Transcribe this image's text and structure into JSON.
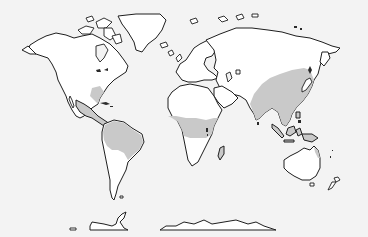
{
  "map": {
    "type": "world-outline-map",
    "projection": "approx. Mercator-like",
    "colors": {
      "background": "#f3f3f3",
      "land": "#ffffff",
      "highlighted_region": "#c9c9c9",
      "outline": "#1e1e1e"
    },
    "highlighted_regions": [
      "South-eastern United States / Gulf coast",
      "Mexico and Central America",
      "Northern South America (Amazon basin, Brazil)",
      "Central Africa band (Sahel to Great Lakes)",
      "Madagascar",
      "East and South Asia (China, India, Indochina)",
      "Maritime Southeast Asia (Indonesia, Philippines, New Guinea)",
      "North-eastern Australia coast"
    ],
    "labels": []
  }
}
